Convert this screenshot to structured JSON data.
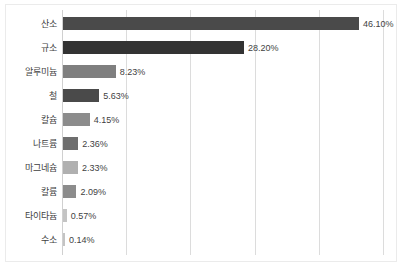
{
  "chart_data": {
    "type": "bar",
    "orientation": "horizontal",
    "title": "",
    "subtitle": "",
    "xlabel": "",
    "ylabel": "",
    "xlim": [
      0,
      50
    ],
    "grid": true,
    "gridlines": [
      0,
      10,
      20,
      30,
      40,
      50
    ],
    "legend": false,
    "legend_position": "none",
    "value_label_suffix": "%",
    "categories": [
      "산소",
      "규소",
      "알루미늄",
      "철",
      "칼슘",
      "나트륨",
      "마그네슘",
      "칼륨",
      "타이타늄",
      "수소"
    ],
    "values": [
      46.1,
      28.2,
      8.23,
      5.63,
      4.15,
      2.36,
      2.33,
      2.09,
      0.57,
      0.14
    ],
    "value_labels": [
      "46.10%",
      "28.20%",
      "8.23%",
      "5.63%",
      "4.15%",
      "2.36%",
      "2.33%",
      "2.09%",
      "0.57%",
      "0.14%"
    ],
    "bar_colors": [
      "#4a4a4a",
      "#333333",
      "#7f7f7f",
      "#4a4a4a",
      "#8c8c8c",
      "#6e6e6e",
      "#b0b0b0",
      "#8c8c8c",
      "#c4c4c4",
      "#c4c4c4"
    ],
    "bars": [
      {
        "category": "산소",
        "value": 46.1,
        "label": "46.10%",
        "color": "#4a4a4a"
      },
      {
        "category": "규소",
        "value": 28.2,
        "label": "28.20%",
        "color": "#333333"
      },
      {
        "category": "알루미늄",
        "value": 8.23,
        "label": "8.23%",
        "color": "#7f7f7f"
      },
      {
        "category": "철",
        "value": 5.63,
        "label": "5.63%",
        "color": "#4a4a4a"
      },
      {
        "category": "칼슘",
        "value": 4.15,
        "label": "4.15%",
        "color": "#8c8c8c"
      },
      {
        "category": "나트륨",
        "value": 2.36,
        "label": "2.36%",
        "color": "#6e6e6e"
      },
      {
        "category": "마그네슘",
        "value": 2.33,
        "label": "2.33%",
        "color": "#b0b0b0"
      },
      {
        "category": "칼륨",
        "value": 2.09,
        "label": "2.09%",
        "color": "#8c8c8c"
      },
      {
        "category": "타이타늄",
        "value": 0.57,
        "label": "0.57%",
        "color": "#c4c4c4"
      },
      {
        "category": "수소",
        "value": 0.14,
        "label": "0.14%",
        "color": "#c4c4c4"
      }
    ],
    "axis_color": "#d0d0d0",
    "grid_color": "#dcdcdc",
    "background_color": "#ffffff",
    "text_color": "#3f3f3f"
  }
}
